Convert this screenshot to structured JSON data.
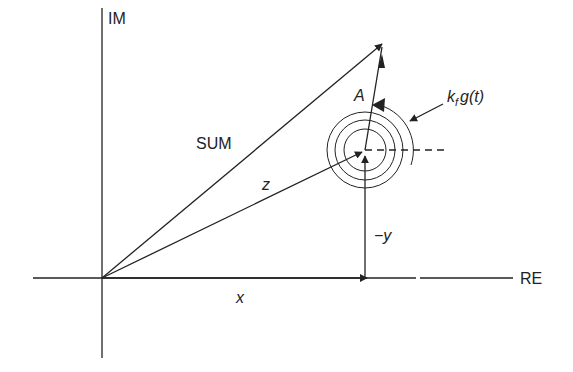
{
  "diagram": {
    "type": "phasor diagram",
    "colors": {
      "stroke": "#222222",
      "background": "#ffffff"
    },
    "axes": {
      "vertical_label": "IM",
      "horizontal_label": "RE"
    },
    "vectors": {
      "sum_label": "SUM",
      "z_label": "z",
      "x_label": "x",
      "y_label": "−y",
      "a_label": "A"
    },
    "rotation": {
      "label_k": "k",
      "label_sub": "f",
      "label_rest": "g(t)"
    }
  }
}
